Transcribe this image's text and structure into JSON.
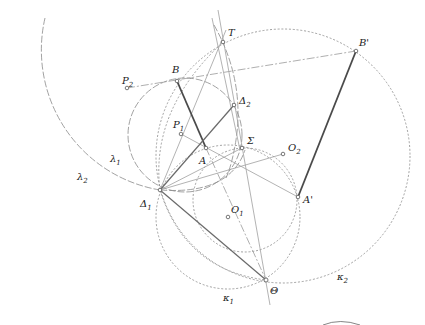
{
  "diagram": {
    "type": "geometric-construction",
    "points": {
      "T": {
        "label": "T",
        "x": 223,
        "y": 42
      },
      "B_prime": {
        "label": "B'",
        "x": 356,
        "y": 51
      },
      "B": {
        "label": "B",
        "x": 177,
        "y": 81
      },
      "P2": {
        "label": "P",
        "sub": "2",
        "x": 127,
        "y": 88
      },
      "Delta2": {
        "label": "Δ",
        "sub": "2",
        "x": 234,
        "y": 105
      },
      "P1": {
        "label": "P",
        "sub": "1",
        "x": 181,
        "y": 134
      },
      "A": {
        "label": "A",
        "x": 206,
        "y": 148
      },
      "Sigma": {
        "label": "Σ",
        "x": 242,
        "y": 148
      },
      "O2": {
        "label": "O",
        "sub": "2",
        "x": 283,
        "y": 154
      },
      "Delta1": {
        "label": "Δ",
        "sub": "1",
        "x": 160,
        "y": 190
      },
      "A_prime": {
        "label": "A'",
        "x": 298,
        "y": 197
      },
      "O1": {
        "label": "O",
        "sub": "1",
        "x": 228,
        "y": 217
      },
      "Theta": {
        "label": "Θ",
        "x": 266,
        "y": 280
      }
    },
    "curves": {
      "lambda1": {
        "label": "λ",
        "sub": "1"
      },
      "lambda2": {
        "label": "λ",
        "sub": "2"
      },
      "kappa1": {
        "label": "κ",
        "sub": "1"
      },
      "kappa2": {
        "label": "κ",
        "sub": "2"
      }
    },
    "colors": {
      "thick_segment": "#4a4a4a",
      "construction": "#8a8a8a",
      "background": "#ffffff"
    }
  }
}
